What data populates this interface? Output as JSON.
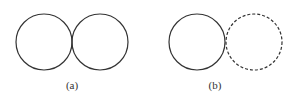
{
  "figures": [
    {
      "label": "(a)",
      "circles": [
        {
          "cx": 44,
          "cy": 42,
          "r": 28,
          "style": "solid"
        },
        {
          "cx": 100,
          "cy": 42,
          "r": 28,
          "style": "solid"
        }
      ]
    },
    {
      "label": "(b)",
      "circles": [
        {
          "cx": 197,
          "cy": 42,
          "r": 28,
          "style": "solid"
        },
        {
          "cx": 254,
          "cy": 42,
          "r": 28,
          "style": "dashed"
        }
      ]
    }
  ],
  "colors": {
    "stroke": "#333333",
    "background": "#ffffff"
  }
}
